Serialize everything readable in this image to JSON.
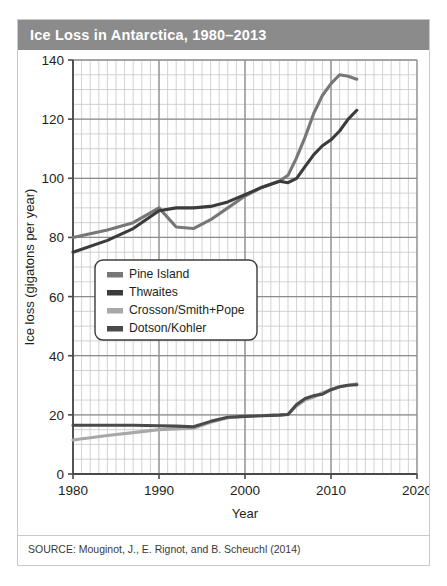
{
  "figure": {
    "title": "Ice Loss in Antarctica, 1980–2013",
    "source": "SOURCE: Mouginot, J., E. Rignot, and B. Scheuchl (2014)"
  },
  "colors": {
    "title_bar": "#8b8b8b",
    "title_text": "#ffffff",
    "pine_island": "#777777",
    "thwaites": "#3b3b3b",
    "crosson": "#a8a8a8",
    "dotson": "#4a4a4a",
    "grid_minor": "#c6c6c6",
    "grid_major": "#8d8d8d",
    "axis": "#4a4a4a",
    "plot_bg": "#ffffff"
  },
  "chart_data": {
    "type": "line",
    "title": "Ice Loss in Antarctica, 1980–2013",
    "xlabel": "Year",
    "ylabel": "Ice loss (gigatons per year)",
    "xlim": [
      1980,
      2020
    ],
    "ylim": [
      0,
      140
    ],
    "xticks": [
      1980,
      1990,
      2000,
      2010,
      2020
    ],
    "yticks": [
      0,
      20,
      40,
      60,
      80,
      100,
      120,
      140
    ],
    "xtick_labels": [
      "1980",
      "1990",
      "2000",
      "2010",
      "2020"
    ],
    "ytick_labels": [
      "0",
      "20",
      "40",
      "60",
      "80",
      "100",
      "120",
      "140"
    ],
    "grid": true,
    "grid_minor_x_step": 1,
    "grid_minor_y_step": 5,
    "legend_position": "center-left",
    "series": [
      {
        "name": "Pine Island",
        "color": "#777777",
        "x": [
          1980,
          1984,
          1987,
          1990,
          1992,
          1994,
          1996,
          1998,
          2000,
          2002,
          2004,
          2005,
          2006,
          2007,
          2008,
          2009,
          2010,
          2011,
          2012,
          2013
        ],
        "values": [
          80,
          82.5,
          85,
          90,
          83.5,
          83,
          86,
          90,
          94,
          97,
          99,
          101,
          107,
          114,
          122,
          128,
          132,
          135,
          134.5,
          133.5
        ]
      },
      {
        "name": "Thwaites",
        "color": "#3b3b3b",
        "x": [
          1980,
          1984,
          1987,
          1990,
          1992,
          1994,
          1996,
          1998,
          2000,
          2002,
          2004,
          2005,
          2006,
          2007,
          2008,
          2009,
          2010,
          2011,
          2012,
          2013
        ],
        "values": [
          75,
          79,
          83,
          89,
          90,
          90,
          90.5,
          92,
          94.5,
          97,
          99,
          98.5,
          100,
          104,
          108,
          111,
          113,
          116,
          120,
          123
        ]
      },
      {
        "name": "Crosson/Smith+Pope",
        "color": "#a8a8a8",
        "x": [
          1980,
          1984,
          1987,
          1990,
          1992,
          1994,
          1996,
          1998,
          2000,
          2002,
          2004,
          2005,
          2006,
          2007,
          2008,
          2009,
          2010,
          2011,
          2012,
          2013
        ],
        "values": [
          11.5,
          13,
          14,
          15,
          15.2,
          15.5,
          17.5,
          19,
          19.5,
          19.8,
          20,
          20.2,
          23,
          25,
          26,
          27.5,
          28.5,
          29.5,
          30,
          30.5
        ]
      },
      {
        "name": "Dotson/Kohler",
        "color": "#4a4a4a",
        "x": [
          1980,
          1984,
          1987,
          1990,
          1992,
          1994,
          1996,
          1998,
          2000,
          2002,
          2004,
          2005,
          2006,
          2007,
          2008,
          2009,
          2010,
          2011,
          2012,
          2013
        ],
        "values": [
          16.5,
          16.5,
          16.5,
          16.3,
          16.2,
          16,
          17.8,
          19.2,
          19.5,
          19.7,
          19.9,
          20.1,
          23.5,
          25.5,
          26.5,
          27,
          28.5,
          29.5,
          30,
          30.2
        ]
      }
    ]
  },
  "legend": {
    "items": [
      {
        "label": "Pine Island",
        "color": "#777777"
      },
      {
        "label": "Thwaites",
        "color": "#3b3b3b"
      },
      {
        "label": "Crosson/Smith+Pope",
        "color": "#a8a8a8"
      },
      {
        "label": "Dotson/Kohler",
        "color": "#4a4a4a"
      }
    ]
  }
}
